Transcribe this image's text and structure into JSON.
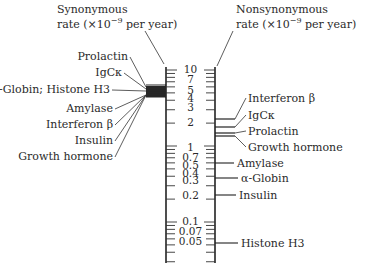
{
  "left_axis": {
    "title_line1": "Synonymous",
    "title_line2_prefix": "rate (×10",
    "title_exponent": "−9",
    "title_line2_suffix": " per year)",
    "genes": [
      {
        "label": "Prolactin",
        "rate": 6.4
      },
      {
        "label": "IgCκ",
        "rate": 6.1
      },
      {
        "label": "α-Globin; Histone H3",
        "rate": 5.6
      },
      {
        "label": "Amylase",
        "rate": 5.3
      },
      {
        "label": "Interferon β",
        "rate": 5.2
      },
      {
        "label": "Insulin",
        "rate": 5.1
      },
      {
        "label": "Growth hormone",
        "rate": 5.0
      }
    ]
  },
  "right_axis": {
    "title_line1": "Nonsynonymous",
    "title_line2_prefix": "rate (×10",
    "title_exponent": "−9",
    "title_line2_suffix": " per year)",
    "genes": [
      {
        "label": "Interferon β",
        "rate": 2.6
      },
      {
        "label": "IgCκ",
        "rate": 2.0
      },
      {
        "label": "Prolactin",
        "rate": 1.7
      },
      {
        "label": "Growth hormone",
        "rate": 1.6
      },
      {
        "label": "Amylase",
        "rate": 1.0
      },
      {
        "label": "α-Globin",
        "rate": 0.7
      },
      {
        "label": "Insulin",
        "rate": 0.2
      },
      {
        "label": "Histone H3",
        "rate": 0.05
      }
    ]
  },
  "scale": {
    "labels": [
      "10",
      "7",
      "5",
      "4",
      "3",
      "2",
      "1",
      "0.7",
      "0.5",
      "0.4",
      "0.3",
      "0.2",
      "0.1",
      "0.07",
      "0.05"
    ],
    "values": [
      10,
      7,
      5,
      4,
      3,
      2,
      1,
      0.7,
      0.5,
      0.4,
      0.3,
      0.2,
      0.1,
      0.07,
      0.05
    ],
    "type": "log"
  }
}
